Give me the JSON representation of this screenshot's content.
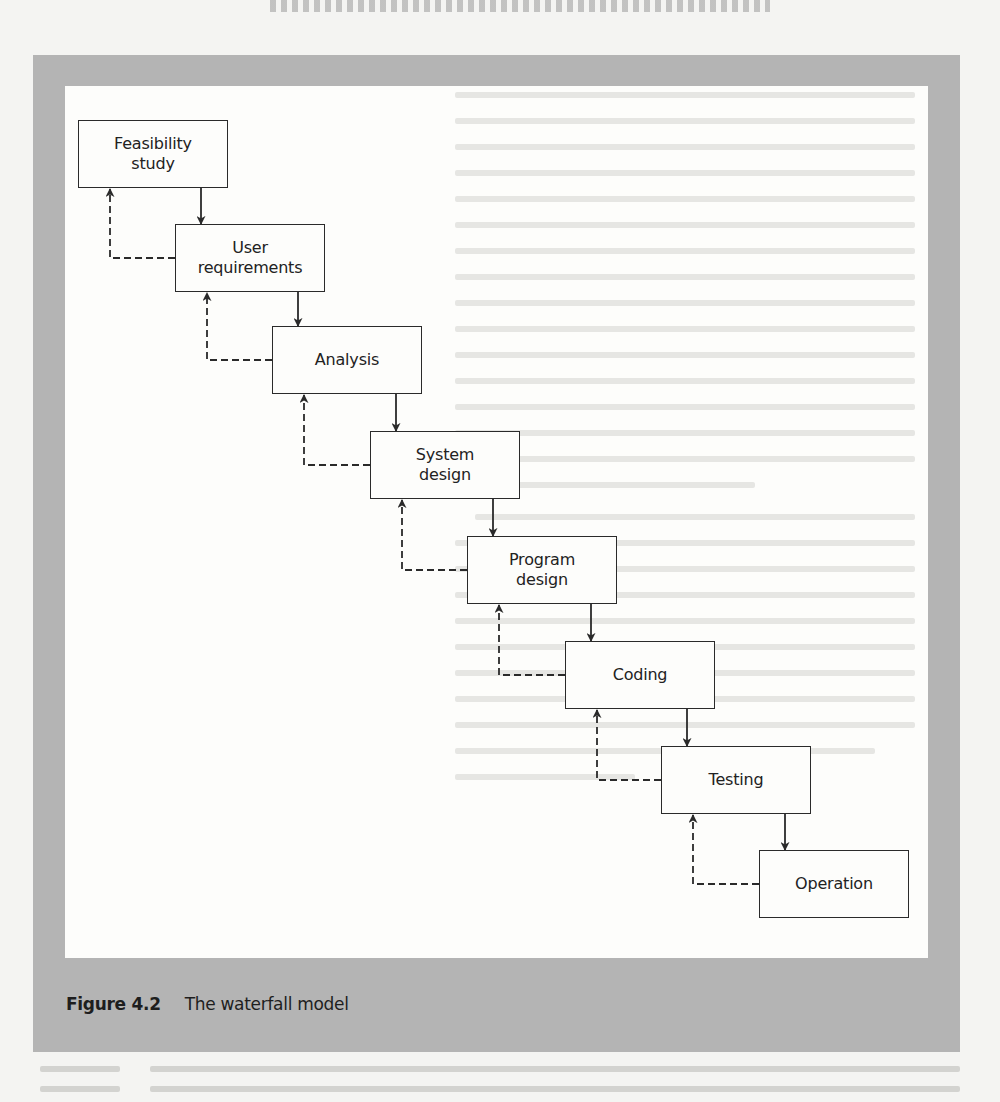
{
  "figure": {
    "number": "Figure 4.2",
    "title": "The waterfall model"
  },
  "diagram": {
    "type": "waterfall",
    "stages": [
      {
        "id": "feasibility",
        "label": "Feasibility\nstudy",
        "x": 78,
        "y": 120
      },
      {
        "id": "user-requirements",
        "label": "User\nrequirements",
        "x": 175,
        "y": 224
      },
      {
        "id": "analysis",
        "label": "Analysis",
        "x": 272,
        "y": 326
      },
      {
        "id": "system-design",
        "label": "System\ndesign",
        "x": 370,
        "y": 431
      },
      {
        "id": "program-design",
        "label": "Program\ndesign",
        "x": 467,
        "y": 536
      },
      {
        "id": "coding",
        "label": "Coding",
        "x": 565,
        "y": 641
      },
      {
        "id": "testing",
        "label": "Testing",
        "x": 661,
        "y": 746
      },
      {
        "id": "operation",
        "label": "Operation",
        "x": 759,
        "y": 850
      }
    ],
    "forward_connector": "solid arrow",
    "feedback_connector": "dashed arrow"
  },
  "colors": {
    "frame": "#b4b4b4",
    "panel": "#fdfdfb",
    "line": "#2a2a2a",
    "text": "#222222"
  }
}
